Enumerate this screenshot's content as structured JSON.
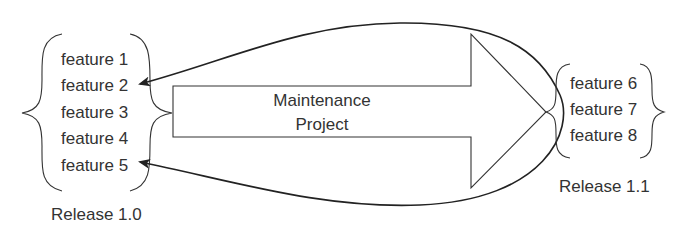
{
  "diagram": {
    "release_old": {
      "label": "Release 1.0",
      "features": [
        "feature 1",
        "feature 2",
        "feature 3",
        "feature 4",
        "feature 5"
      ]
    },
    "project": {
      "label_line1": "Maintenance",
      "label_line2": "Project"
    },
    "release_new": {
      "label": "Release 1.1",
      "features": [
        "feature 6",
        "feature 7",
        "feature 8"
      ]
    },
    "colors": {
      "line": "#222222",
      "text": "#333333",
      "background": "#ffffff"
    }
  }
}
